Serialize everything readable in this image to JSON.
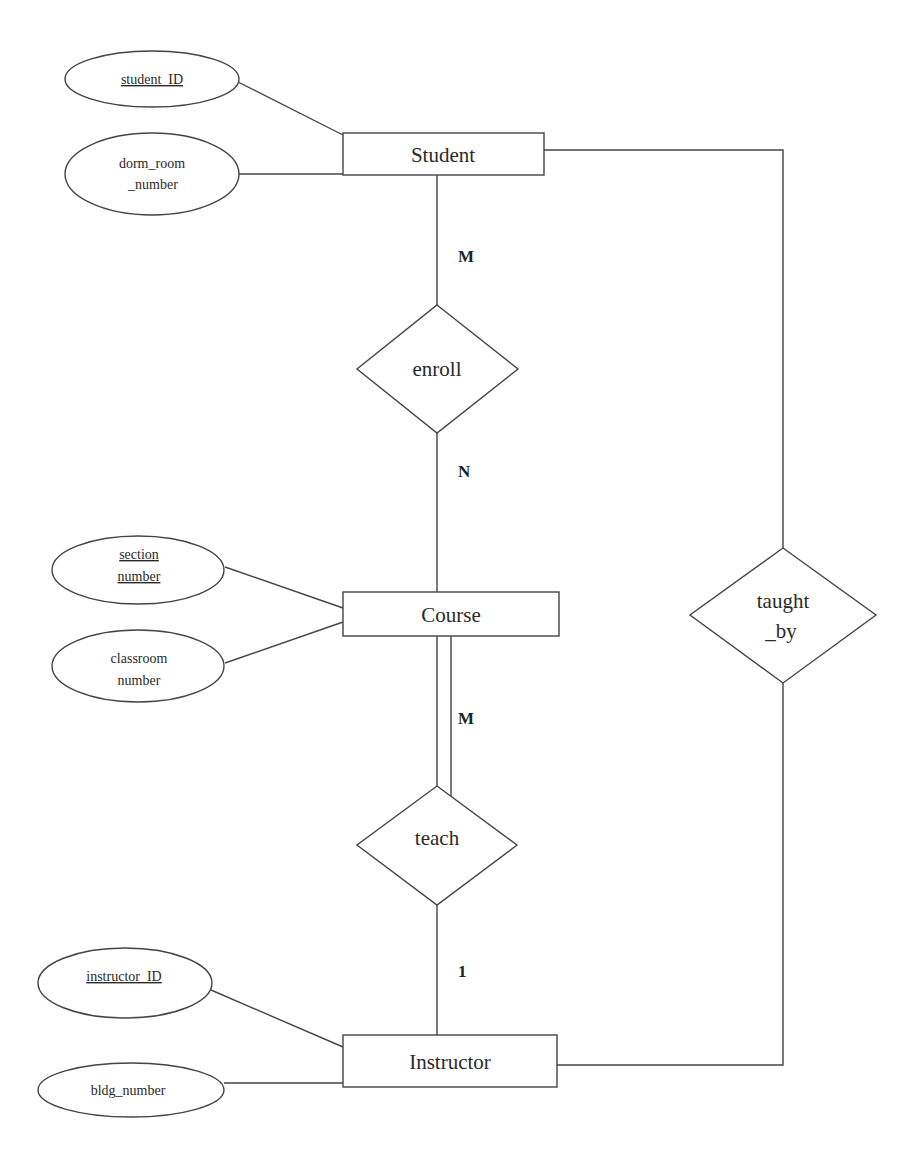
{
  "diagram": {
    "type": "er-diagram",
    "entities": [
      {
        "name": "Student",
        "label": "Student"
      },
      {
        "name": "Course",
        "label": "Course"
      },
      {
        "name": "Instructor",
        "label": "Instructor"
      }
    ],
    "relationships": [
      {
        "name": "enroll",
        "label": "enroll"
      },
      {
        "name": "teach",
        "label": "teach"
      },
      {
        "name": "taught_by",
        "label_line1": "taught",
        "label_line2": "_by"
      }
    ],
    "attributes": {
      "student_id": {
        "label": "student_ID",
        "key": true,
        "entity": "Student"
      },
      "dorm_room_number": {
        "line1": "dorm_room",
        "line2": "_number",
        "key": false,
        "entity": "Student"
      },
      "section_number": {
        "line1": "section",
        "line2": "number",
        "key": true,
        "entity": "Course"
      },
      "classroom_number": {
        "line1": "classroom",
        "line2": "number",
        "key": false,
        "entity": "Course"
      },
      "instructor_id": {
        "label": "instructor_ID",
        "key": true,
        "entity": "Instructor"
      },
      "bldg_number": {
        "label": "bldg_number",
        "key": false,
        "entity": "Instructor"
      }
    },
    "cardinalities": {
      "student_enroll": "M",
      "enroll_course": "N",
      "course_teach": "M",
      "teach_instructor": "1"
    },
    "colors": {
      "stroke": "#444444",
      "text": "#2a2a2a",
      "background": "#ffffff"
    }
  }
}
